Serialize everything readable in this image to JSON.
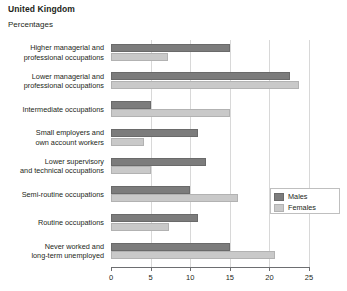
{
  "header": {
    "title": "United Kingdom",
    "subtitle": "Percentages"
  },
  "legend": {
    "males_label": "Males",
    "females_label": "Females"
  },
  "axis": {
    "ticks": [
      "0",
      "5",
      "10",
      "15",
      "20",
      "25"
    ]
  },
  "categories": [
    "Higher managerial and\nprofessional occupations",
    "Lower managerial and\nprofessional occupations",
    "Intermediate occupations",
    "Small employers and\nown account workers",
    "Lower supervisory\nand technical occupations",
    "Semi-routine occupations",
    "Routine occupations",
    "Never worked and\nlong-term unemployed"
  ],
  "chart_data": {
    "type": "bar",
    "orientation": "horizontal",
    "title": "United Kingdom",
    "subtitle": "Percentages",
    "xlabel": "",
    "ylabel": "",
    "xlim": [
      0,
      25
    ],
    "xticks": [
      0,
      5,
      10,
      15,
      20,
      25
    ],
    "grid": true,
    "legend_position": "right-middle",
    "categories": [
      "Higher managerial and professional occupations",
      "Lower managerial and professional occupations",
      "Intermediate occupations",
      "Small employers and own account workers",
      "Lower supervisory and technical occupations",
      "Semi-routine occupations",
      "Routine occupations",
      "Never worked and long-term unemployed"
    ],
    "series": [
      {
        "name": "Males",
        "color": "#7c7c7c",
        "values": [
          15.0,
          22.6,
          5.0,
          11.0,
          12.0,
          10.0,
          11.0,
          15.0
        ]
      },
      {
        "name": "Females",
        "color": "#c9c9c9",
        "values": [
          7.2,
          23.8,
          15.0,
          4.2,
          5.0,
          16.0,
          7.3,
          20.7
        ]
      }
    ]
  }
}
